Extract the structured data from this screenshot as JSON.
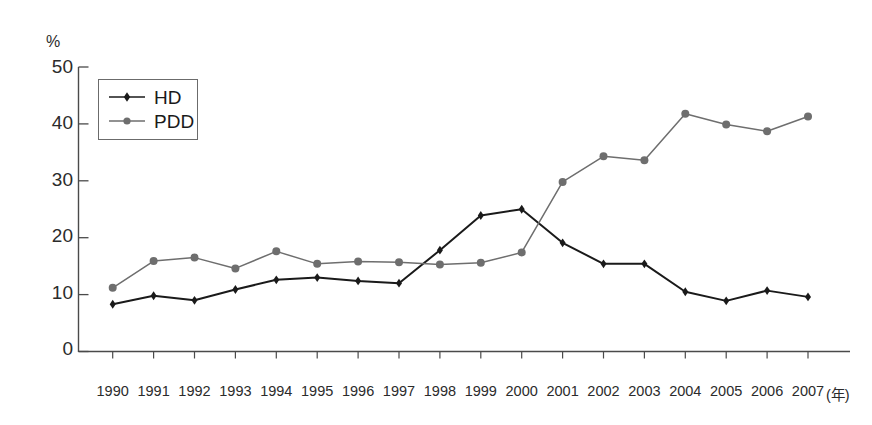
{
  "chart_data": {
    "type": "line",
    "title": "",
    "subtitle": "",
    "xlabel": "年",
    "ylabel": "%",
    "x": [
      1990,
      1991,
      1992,
      1993,
      1994,
      1995,
      1996,
      1997,
      1998,
      1999,
      2000,
      2001,
      2002,
      2003,
      2004,
      2005,
      2006,
      2007
    ],
    "categories": [
      "1990",
      "1991",
      "1992",
      "1993",
      "1994",
      "1995",
      "1996",
      "1997",
      "1998",
      "1999",
      "2000",
      "2001",
      "2002",
      "2003",
      "2004",
      "2005",
      "2006",
      "2007"
    ],
    "series": [
      {
        "name": "HD",
        "color": "#1a1a1a",
        "marker": "diamond",
        "values": [
          8.3,
          9.8,
          9.0,
          10.9,
          12.6,
          13.0,
          12.4,
          12.0,
          17.8,
          23.9,
          25.0,
          19.1,
          15.4,
          15.4,
          10.5,
          8.9,
          10.7,
          9.6
        ]
      },
      {
        "name": "PDD",
        "color": "#6e6e6e",
        "marker": "circle",
        "values": [
          11.2,
          15.9,
          16.5,
          14.6,
          17.6,
          15.4,
          15.8,
          15.7,
          15.3,
          15.6,
          17.4,
          29.8,
          34.3,
          33.6,
          41.8,
          39.9,
          38.7,
          41.3
        ]
      }
    ],
    "ylim": [
      0,
      50
    ],
    "yticks": [
      0,
      10,
      20,
      30,
      40,
      50
    ],
    "ytick_labels": [
      "0",
      "10",
      "20",
      "30",
      "40",
      "50"
    ],
    "xlim": [
      1990,
      2007
    ],
    "grid": false,
    "legend_position": "top-left",
    "legend_entries": [
      "HD",
      "PDD"
    ]
  },
  "axis": {
    "unit_label": "%",
    "x_unit_suffix": "(年)"
  }
}
